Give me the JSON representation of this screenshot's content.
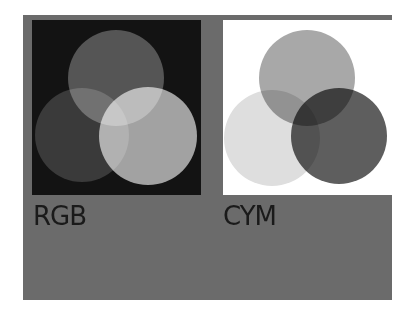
{
  "figure": {
    "panels": [
      {
        "id": "rgb",
        "label": "RGB",
        "background": "#131313",
        "blend": "additive",
        "circles": [
          {
            "name": "top",
            "cx": 84,
            "cy": 58,
            "r": 48,
            "fill": "#555555"
          },
          {
            "name": "bottom-left",
            "cx": 50,
            "cy": 115,
            "r": 47,
            "fill": "#2a2a2a"
          },
          {
            "name": "bottom-right",
            "cx": 116,
            "cy": 116,
            "r": 49,
            "fill": "#9a9a9a"
          }
        ]
      },
      {
        "id": "cym",
        "label": "CYM",
        "background": "#ffffff",
        "blend": "subtractive",
        "circles": [
          {
            "name": "top",
            "cx": 84,
            "cy": 58,
            "r": 48,
            "fill": "#a8a8a8"
          },
          {
            "name": "bottom-left",
            "cx": 49,
            "cy": 118,
            "r": 48,
            "fill": "#dedede"
          },
          {
            "name": "bottom-right",
            "cx": 116,
            "cy": 116,
            "r": 48,
            "fill": "#5e5e5e"
          }
        ]
      }
    ],
    "frame_color": "#6b6b6b"
  }
}
